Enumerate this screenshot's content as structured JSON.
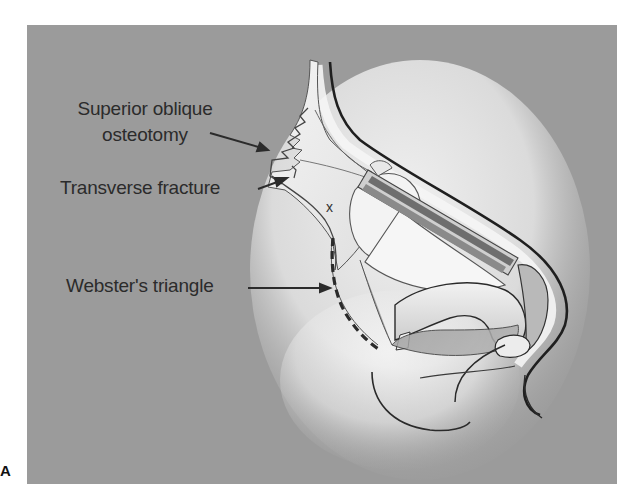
{
  "figure": {
    "panel_letter": "A",
    "background_color": "#9b9b9b",
    "label_color": "#2b2b2b",
    "labels": [
      {
        "id": "superior-oblique-osteotomy",
        "line1": "Superior oblique",
        "line2": "osteotomy"
      },
      {
        "id": "transverse-fracture",
        "text": "Transverse fracture"
      },
      {
        "id": "websters-triangle",
        "text": "Webster's triangle"
      }
    ],
    "markers": [
      {
        "id": "x-mark",
        "text": "x"
      }
    ]
  }
}
